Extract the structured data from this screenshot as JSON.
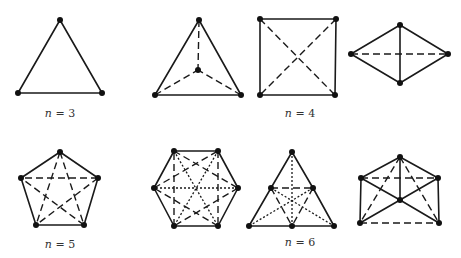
{
  "figures": [
    {
      "id": "triangle",
      "label_group": "n3",
      "vertices": [
        [
          60,
          20
        ],
        [
          18,
          93
        ],
        [
          102,
          93
        ]
      ],
      "edges": [
        [
          0,
          1,
          "solid"
        ],
        [
          1,
          2,
          "solid"
        ],
        [
          2,
          0,
          "solid"
        ]
      ]
    },
    {
      "id": "tetrahedron",
      "label_group": "n4",
      "vertices": [
        [
          199,
          20
        ],
        [
          155,
          95
        ],
        [
          241,
          95
        ],
        [
          198,
          70
        ]
      ],
      "edges": [
        [
          0,
          1,
          "solid"
        ],
        [
          1,
          2,
          "solid"
        ],
        [
          2,
          0,
          "solid"
        ],
        [
          0,
          3,
          "dashed"
        ],
        [
          1,
          3,
          "dashed"
        ],
        [
          2,
          3,
          "dashed"
        ]
      ]
    },
    {
      "id": "square-with-diagonals",
      "label_group": "n4",
      "vertices": [
        [
          260,
          19
        ],
        [
          336,
          19
        ],
        [
          335,
          95
        ],
        [
          260,
          95
        ]
      ],
      "edges": [
        [
          0,
          1,
          "solid"
        ],
        [
          1,
          2,
          "solid"
        ],
        [
          2,
          3,
          "solid"
        ],
        [
          3,
          0,
          "solid"
        ],
        [
          0,
          2,
          "dashed"
        ],
        [
          1,
          3,
          "dashed"
        ]
      ]
    },
    {
      "id": "diamond",
      "label_group": "n4",
      "vertices": [
        [
          400,
          25
        ],
        [
          351,
          54
        ],
        [
          448,
          54
        ],
        [
          400,
          83
        ]
      ],
      "edges": [
        [
          0,
          1,
          "solid"
        ],
        [
          0,
          2,
          "solid"
        ],
        [
          1,
          3,
          "solid"
        ],
        [
          2,
          3,
          "solid"
        ],
        [
          0,
          3,
          "solid"
        ],
        [
          1,
          2,
          "dashed"
        ]
      ]
    },
    {
      "id": "pentagon-complete",
      "label_group": "n5",
      "vertices": [
        [
          60,
          152
        ],
        [
          98,
          178
        ],
        [
          84,
          225
        ],
        [
          36,
          225
        ],
        [
          21,
          178
        ]
      ],
      "edges": [
        [
          0,
          1,
          "solid"
        ],
        [
          1,
          2,
          "solid"
        ],
        [
          2,
          3,
          "solid"
        ],
        [
          3,
          4,
          "solid"
        ],
        [
          4,
          0,
          "solid"
        ],
        [
          0,
          2,
          "dashed"
        ],
        [
          0,
          3,
          "dashed"
        ],
        [
          1,
          3,
          "dashed"
        ],
        [
          1,
          4,
          "dashed"
        ],
        [
          2,
          4,
          "dashed"
        ]
      ]
    },
    {
      "id": "hexagon-complete",
      "label_group": "n6",
      "vertices": [
        [
          174,
          151
        ],
        [
          218,
          151
        ],
        [
          238,
          188
        ],
        [
          218,
          226
        ],
        [
          174,
          226
        ],
        [
          154,
          188
        ]
      ],
      "edges": [
        [
          0,
          1,
          "solid"
        ],
        [
          1,
          2,
          "solid"
        ],
        [
          2,
          3,
          "solid"
        ],
        [
          3,
          4,
          "solid"
        ],
        [
          4,
          5,
          "solid"
        ],
        [
          5,
          0,
          "solid"
        ],
        [
          0,
          2,
          "dashed"
        ],
        [
          1,
          3,
          "dashed"
        ],
        [
          2,
          4,
          "dashed"
        ],
        [
          3,
          5,
          "dashed"
        ],
        [
          4,
          0,
          "dashed"
        ],
        [
          5,
          1,
          "dashed"
        ],
        [
          0,
          3,
          "dotted"
        ],
        [
          1,
          4,
          "dotted"
        ],
        [
          2,
          5,
          "dotted"
        ]
      ]
    },
    {
      "id": "triangle-subdivided",
      "label_group": "n6",
      "vertices": [
        [
          292,
          152
        ],
        [
          271,
          188
        ],
        [
          313,
          188
        ],
        [
          249,
          226
        ],
        [
          292,
          226
        ],
        [
          334,
          226
        ]
      ],
      "edges": [
        [
          0,
          1,
          "solid"
        ],
        [
          1,
          3,
          "solid"
        ],
        [
          0,
          2,
          "solid"
        ],
        [
          2,
          5,
          "solid"
        ],
        [
          3,
          4,
          "solid"
        ],
        [
          4,
          5,
          "solid"
        ],
        [
          1,
          2,
          "dashed"
        ],
        [
          1,
          4,
          "dashed"
        ],
        [
          2,
          4,
          "dashed"
        ],
        [
          0,
          4,
          "dotted"
        ],
        [
          1,
          5,
          "dotted"
        ],
        [
          2,
          3,
          "dotted"
        ]
      ]
    },
    {
      "id": "prism-with-apex",
      "label_group": "n6",
      "vertices": [
        [
          400,
          157
        ],
        [
          361,
          178
        ],
        [
          438,
          178
        ],
        [
          400,
          200
        ],
        [
          360,
          223
        ],
        [
          439,
          223
        ]
      ],
      "edges": [
        [
          0,
          1,
          "solid"
        ],
        [
          0,
          2,
          "solid"
        ],
        [
          0,
          3,
          "solid"
        ],
        [
          1,
          4,
          "solid"
        ],
        [
          2,
          5,
          "solid"
        ],
        [
          1,
          3,
          "solid"
        ],
        [
          3,
          5,
          "solid"
        ],
        [
          2,
          3,
          "solid"
        ],
        [
          3,
          4,
          "solid"
        ],
        [
          1,
          2,
          "dashed"
        ],
        [
          0,
          4,
          "dashed"
        ],
        [
          0,
          5,
          "dashed"
        ],
        [
          4,
          5,
          "dashed"
        ]
      ]
    }
  ],
  "labels": [
    {
      "id": "n3",
      "var": "n",
      "eq": " = ",
      "value": "3",
      "x": 60,
      "y": 117
    },
    {
      "id": "n4",
      "var": "n",
      "eq": " = ",
      "value": "4",
      "x": 300,
      "y": 117
    },
    {
      "id": "n5",
      "var": "n",
      "eq": " = ",
      "value": "5",
      "x": 60,
      "y": 248
    },
    {
      "id": "n6",
      "var": "n",
      "eq": " = ",
      "value": "6",
      "x": 300,
      "y": 246
    }
  ],
  "colors": {
    "line": "#1a1a1a",
    "vertex": "#111111",
    "label": "#333333",
    "background": "#ffffff"
  }
}
